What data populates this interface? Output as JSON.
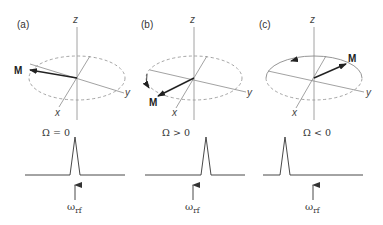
{
  "figure": {
    "panels": [
      {
        "id": "a",
        "label": "(a)",
        "axes": {
          "z": "z",
          "y": "y",
          "x": "x"
        },
        "vector_label": "M",
        "rotation_arrow": "none",
        "offset_condition": "Ω = 0",
        "peak_position": "at ω_rf",
        "rf_label_main": "ω",
        "rf_label_sub": "rf"
      },
      {
        "id": "b",
        "label": "(b)",
        "axes": {
          "z": "z",
          "y": "y",
          "x": "x"
        },
        "vector_label": "M",
        "rotation_arrow": "counter-clockwise (toward -y)",
        "offset_condition": "Ω > 0",
        "peak_position": "right of ω_rf",
        "rf_label_main": "ω",
        "rf_label_sub": "rf"
      },
      {
        "id": "c",
        "label": "(c)",
        "axes": {
          "z": "z",
          "y": "y",
          "x": "x"
        },
        "vector_label": "M",
        "rotation_arrow": "clockwise (toward -y via +x side)",
        "offset_condition": "Ω < 0",
        "peak_position": "left of ω_rf",
        "rf_label_main": "ω",
        "rf_label_sub": "rf"
      }
    ],
    "colors": {
      "axis": "#8a8a8a",
      "ellipse": "#9a9a9a",
      "vector": "#222222",
      "text": "#333333"
    }
  }
}
